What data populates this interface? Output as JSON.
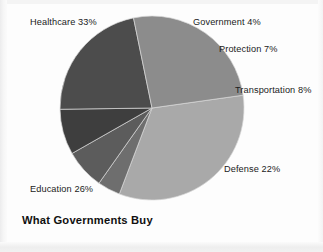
{
  "figure": {
    "title": "What Governments Buy",
    "background_color": "#fdfdfd",
    "page_border_color": "#f1f1f1"
  },
  "chart_data": {
    "type": "pie",
    "title": "What Governments Buy",
    "subtitle": "",
    "xlabel": "",
    "ylabel": "",
    "grid": false,
    "legend_position": "none",
    "label_style": "outside-direct-labels",
    "units": "percent",
    "total": 100,
    "start_angle_deg": -8,
    "direction": "clockwise",
    "center": {
      "x": 152,
      "y": 108
    },
    "radius": 92,
    "categories": [
      "Healthcare",
      "Government",
      "Protection",
      "Transportation",
      "Defense",
      "Education"
    ],
    "values": [
      33,
      4,
      7,
      8,
      22,
      26
    ],
    "colors": [
      "#a9a9a9",
      "#6e6e6e",
      "#5c5c5c",
      "#3e3e3e",
      "#4c4c4c",
      "#8c8c8c"
    ],
    "slices": [
      {
        "name": "Healthcare",
        "value": 33,
        "label": "Healthcare 33%",
        "color": "#a9a9a9",
        "label_x": 30,
        "label_y": 17
      },
      {
        "name": "Government",
        "value": 4,
        "label": "Government 4%",
        "color": "#6e6e6e",
        "label_x": 193,
        "label_y": 17
      },
      {
        "name": "Protection",
        "value": 7,
        "label": "Protection 7%",
        "color": "#5c5c5c",
        "label_x": 219,
        "label_y": 44
      },
      {
        "name": "Transportation",
        "value": 8,
        "label": "Transportation 8%",
        "color": "#3e3e3e",
        "label_x": 235,
        "label_y": 85
      },
      {
        "name": "Defense",
        "value": 22,
        "label": "Defense 22%",
        "color": "#4c4c4c",
        "label_x": 224,
        "label_y": 164
      },
      {
        "name": "Education",
        "value": 26,
        "label": "Education 26%",
        "color": "#8c8c8c",
        "label_x": 30,
        "label_y": 184
      }
    ]
  }
}
